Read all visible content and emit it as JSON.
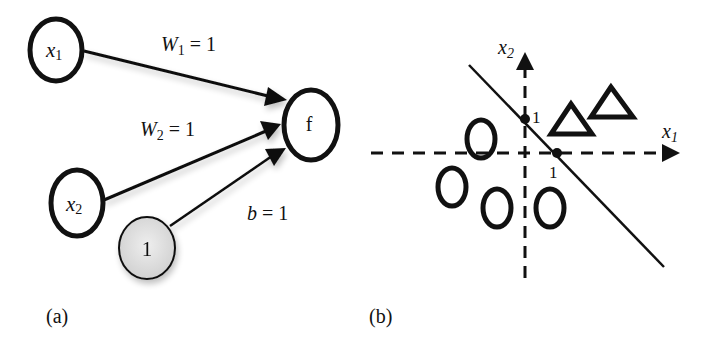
{
  "panel_a": {
    "caption": "(a)",
    "nodes": {
      "x1": {
        "base": "x",
        "sub": "1"
      },
      "x2": {
        "base": "x",
        "sub": "2"
      },
      "bias": {
        "label": "1"
      },
      "output": {
        "label": "f"
      }
    },
    "edges": {
      "w1": {
        "base": "W",
        "sub": "1",
        "rest": " = 1"
      },
      "w2": {
        "base": "W",
        "sub": "2",
        "rest": " = 1"
      },
      "b": {
        "base": "b",
        "rest": " = 1"
      }
    }
  },
  "panel_b": {
    "caption": "(b)",
    "axes": {
      "x1": {
        "base": "x",
        "sub": "1"
      },
      "x2": {
        "base": "x",
        "sub": "2"
      }
    },
    "intercepts": {
      "x1_tick": "1",
      "x2_tick": "1"
    },
    "classes": {
      "circle_count": 4,
      "triangle_count": 2
    },
    "decision_boundary": "x1 + x2 = 1"
  },
  "colors": {
    "stroke": "#111111",
    "bias_fill": "#d9d9d9",
    "background": "#ffffff"
  }
}
